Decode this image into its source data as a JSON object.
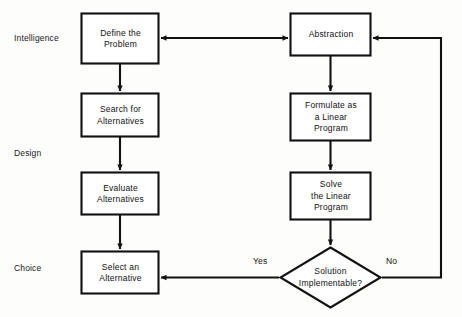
{
  "diagram": {
    "type": "flowchart",
    "background_color": "#fdfdfc",
    "stroke_color": "#111111",
    "text_color": "#101010",
    "stage_labels": [
      {
        "id": "intelligence",
        "text": "Intelligence"
      },
      {
        "id": "design",
        "text": "Design"
      },
      {
        "id": "choice",
        "text": "Choice"
      }
    ],
    "nodes": [
      {
        "id": "define-the-problem",
        "shape": "rect",
        "lines": [
          "Define the",
          "Problem"
        ],
        "column": "left",
        "stage": "intelligence"
      },
      {
        "id": "search-for-alternatives",
        "shape": "rect",
        "lines": [
          "Search for",
          "Alternatives"
        ],
        "column": "left",
        "stage": "design"
      },
      {
        "id": "evaluate-alternatives",
        "shape": "rect",
        "lines": [
          "Evaluate",
          "Alternatives"
        ],
        "column": "left",
        "stage": "design"
      },
      {
        "id": "select-an-alternative",
        "shape": "rect",
        "lines": [
          "Select an",
          "Alternative"
        ],
        "column": "left",
        "stage": "choice"
      },
      {
        "id": "abstraction",
        "shape": "rect",
        "lines": [
          "Abstraction"
        ],
        "column": "right",
        "stage": "intelligence"
      },
      {
        "id": "formulate-as-a-linear-program",
        "shape": "rect",
        "lines": [
          "Formulate as",
          "a Linear",
          "Program"
        ],
        "column": "right",
        "stage": "design"
      },
      {
        "id": "solve-the-linear-program",
        "shape": "rect",
        "lines": [
          "Solve",
          "the Linear",
          "Program"
        ],
        "column": "right",
        "stage": "design"
      },
      {
        "id": "solution-implementable",
        "shape": "diamond",
        "lines": [
          "Solution",
          "Implementable?"
        ],
        "column": "right",
        "stage": "choice"
      }
    ],
    "edges": [
      {
        "id": "define-to-search",
        "from": "define-the-problem",
        "to": "search-for-alternatives",
        "label": ""
      },
      {
        "id": "search-to-evaluate",
        "from": "search-for-alternatives",
        "to": "evaluate-alternatives",
        "label": ""
      },
      {
        "id": "evaluate-to-select",
        "from": "evaluate-alternatives",
        "to": "select-an-alternative",
        "label": ""
      },
      {
        "id": "define-abstraction-bidirectional",
        "from": "define-the-problem",
        "to": "abstraction",
        "label": "",
        "bidirectional": true
      },
      {
        "id": "abstraction-to-formulate",
        "from": "abstraction",
        "to": "formulate-as-a-linear-program",
        "label": ""
      },
      {
        "id": "formulate-to-solve",
        "from": "formulate-as-a-linear-program",
        "to": "solve-the-linear-program",
        "label": ""
      },
      {
        "id": "solve-to-decision",
        "from": "solve-the-linear-program",
        "to": "solution-implementable",
        "label": ""
      },
      {
        "id": "decision-yes-to-select",
        "from": "solution-implementable",
        "to": "select-an-alternative",
        "label": "Yes"
      },
      {
        "id": "decision-no-to-abstraction",
        "from": "solution-implementable",
        "to": "abstraction",
        "label": "No"
      }
    ],
    "edge_labels": [
      {
        "id": "yes-label",
        "text": "Yes"
      },
      {
        "id": "no-label",
        "text": "No"
      }
    ]
  }
}
